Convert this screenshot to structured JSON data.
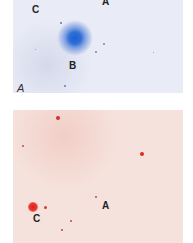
{
  "figure": {
    "top_panel": {
      "color_scheme": "blue",
      "accent_color": "#2f6fd8",
      "background_color": "#e9ecf6",
      "panel_label": "A",
      "labels": [
        {
          "text": "C",
          "x": 34,
          "y": 5
        },
        {
          "text": "A",
          "x": 102,
          "y": -3
        },
        {
          "text": "B",
          "x": 70,
          "y": 61
        }
      ]
    },
    "bottom_panel": {
      "color_scheme": "red",
      "accent_color": "#e0302a",
      "background_color": "#f6e2dc",
      "labels": [
        {
          "text": "A",
          "x": 102,
          "y": 201
        },
        {
          "text": "C",
          "x": 33,
          "y": 214
        }
      ]
    }
  }
}
